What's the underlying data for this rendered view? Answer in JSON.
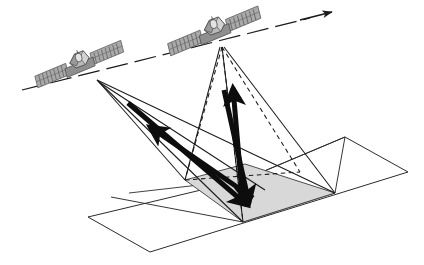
{
  "diagram": {
    "background_color": "#ffffff",
    "stroke_color": "#1a1a1a",
    "footprint_fill": "#d8d8d8",
    "satellite_body_color": "#8c8c8c",
    "satellite_panel_color": "#a8a8a8",
    "satellite_panel_dark": "#6e6e6e",
    "width": 424,
    "height": 265
  },
  "orbit": {
    "name": "orbit-track",
    "label": "orbit track",
    "style": "dashed",
    "points": "22,90 310,18",
    "arrow_label": "flight direction",
    "arrow_tip": "334,12"
  },
  "satellites": [
    {
      "id": "satellite-1",
      "label": "satellite 1 (earlier pass position)",
      "x": 80,
      "y": 67,
      "rotation": -14,
      "scale": 1.0,
      "apex_x": 97,
      "apex_y": 80
    },
    {
      "id": "satellite-2",
      "label": "satellite 2 (later pass position)",
      "x": 215,
      "y": 34,
      "rotation": -14,
      "scale": 1.05,
      "apex_x": 222,
      "apex_y": 47
    }
  ],
  "ground_plane": {
    "name": "ground-plane",
    "label": "ground plane",
    "points": "88,217 243,180 345,137 408,172 150,252",
    "outline_points": "88,217 243,180 345,137 408,172 150,252"
  },
  "footprint": {
    "name": "footprint-patch",
    "label": "illuminated ground footprint",
    "points": "185,180 245,164 335,193 243,222",
    "fill": "#d8d8d8"
  },
  "beams": [
    {
      "id": "beam-sat1-solid",
      "label": "solid beam cone from satellite 1",
      "style": "solid",
      "points": "97,80 185,180 243,222 335,193"
    },
    {
      "id": "beam-sat2-solid",
      "label": "solid beam cone from satellite 2",
      "style": "solid",
      "points": "222,47 185,180 243,222 335,193"
    },
    {
      "id": "beam-sat2-dashed",
      "label": "dashed beam cone from satellite 2",
      "style": "dashed",
      "points": "222,47 185,180 243,222 300,172"
    }
  ],
  "vectors": [
    {
      "id": "vector-downlink-sat1",
      "label": "transmit path satellite 1 to target",
      "from_x": 128,
      "from_y": 103,
      "to_x": 247,
      "to_y": 205,
      "direction": "down-right",
      "weight": 5
    },
    {
      "id": "vector-backscatter-sat1",
      "label": "backscatter path target to satellite 1",
      "from_x": 253,
      "from_y": 198,
      "to_x": 150,
      "to_y": 127,
      "direction": "up-left",
      "weight": 5
    },
    {
      "id": "vector-uplink-sat2",
      "label": "scattered path target to satellite 2",
      "from_x": 243,
      "from_y": 205,
      "to_x": 233,
      "to_y": 88,
      "direction": "up",
      "weight": 5
    },
    {
      "id": "vector-downlink-sat2",
      "label": "transmit path satellite 2 to target",
      "from_x": 224,
      "from_y": 90,
      "to_x": 249,
      "to_y": 203,
      "direction": "down",
      "weight": 5
    }
  ]
}
